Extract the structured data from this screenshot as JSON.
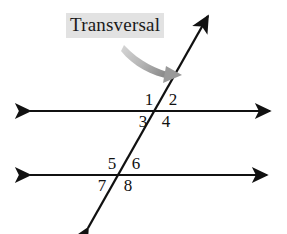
{
  "figure": {
    "title_label": "Transversal",
    "canvas": {
      "width": 287,
      "height": 234,
      "background": "#ffffff"
    },
    "colors": {
      "line": "#111111",
      "text": "#111111",
      "pointer_arrow": "#9a9a9a",
      "label_highlight": "#e2e2e2"
    },
    "lines": [
      {
        "name": "upper-parallel-line",
        "kind": "horizontal",
        "x1": 30,
        "y1": 111,
        "x2": 270,
        "y2": 111,
        "arrowheads": "both"
      },
      {
        "name": "lower-parallel-line",
        "kind": "horizontal",
        "x1": 30,
        "y1": 175,
        "x2": 267,
        "y2": 175,
        "arrowheads": "both"
      },
      {
        "name": "transversal-line",
        "kind": "oblique",
        "x1": 88,
        "y1": 228,
        "x2": 208,
        "y2": 16,
        "arrowheads": "both"
      }
    ],
    "intersections": [
      {
        "name": "upper-intersection",
        "x": 160,
        "y": 111
      },
      {
        "name": "lower-intersection",
        "x": 123,
        "y": 175
      }
    ],
    "pointer_arrow": {
      "name": "curved-pointer-arrow",
      "from_x": 125,
      "from_y": 47,
      "to_x": 178,
      "to_y": 72
    },
    "label_position": {
      "x": 66,
      "y": 13
    },
    "angles": [
      {
        "id": "1",
        "text": "1",
        "x": 149,
        "y": 100,
        "position": "upper-left"
      },
      {
        "id": "2",
        "text": "2",
        "x": 173,
        "y": 100,
        "position": "upper-right"
      },
      {
        "id": "3",
        "text": "3",
        "x": 143,
        "y": 122,
        "position": "lower-left"
      },
      {
        "id": "4",
        "text": "4",
        "x": 166,
        "y": 122,
        "position": "lower-right"
      },
      {
        "id": "5",
        "text": "5",
        "x": 112,
        "y": 164,
        "position": "upper-left"
      },
      {
        "id": "6",
        "text": "6",
        "x": 136,
        "y": 164,
        "position": "upper-right"
      },
      {
        "id": "7",
        "text": "7",
        "x": 102,
        "y": 186,
        "position": "lower-left"
      },
      {
        "id": "8",
        "text": "8",
        "x": 128,
        "y": 186,
        "position": "lower-right"
      }
    ]
  }
}
